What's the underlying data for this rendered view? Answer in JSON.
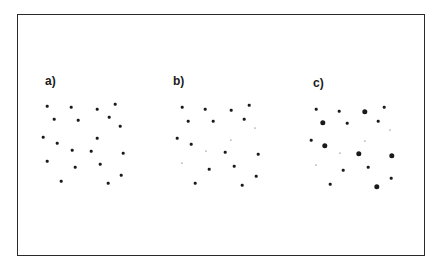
{
  "figure": {
    "panels": [
      {
        "label": "a)",
        "label_pos": [
          45,
          86
        ],
        "dots": [
          {
            "x": 47,
            "y": 106,
            "r": 1.3
          },
          {
            "x": 71,
            "y": 107,
            "r": 1.3
          },
          {
            "x": 97,
            "y": 109,
            "r": 1.3
          },
          {
            "x": 115,
            "y": 104,
            "r": 1.3
          },
          {
            "x": 54,
            "y": 119,
            "r": 1.3
          },
          {
            "x": 78,
            "y": 120,
            "r": 1.3
          },
          {
            "x": 109,
            "y": 117,
            "r": 1.3
          },
          {
            "x": 120,
            "y": 126,
            "r": 1.3
          },
          {
            "x": 43,
            "y": 137,
            "r": 1.3
          },
          {
            "x": 57,
            "y": 143,
            "r": 1.3
          },
          {
            "x": 97,
            "y": 138,
            "r": 1.3
          },
          {
            "x": 72,
            "y": 150,
            "r": 1.3
          },
          {
            "x": 91,
            "y": 151,
            "r": 1.3
          },
          {
            "x": 123,
            "y": 153,
            "r": 1.3
          },
          {
            "x": 47,
            "y": 161,
            "r": 1.3
          },
          {
            "x": 75,
            "y": 167,
            "r": 1.3
          },
          {
            "x": 100,
            "y": 164,
            "r": 1.3
          },
          {
            "x": 121,
            "y": 175,
            "r": 1.3
          },
          {
            "x": 61,
            "y": 181,
            "r": 1.3
          },
          {
            "x": 108,
            "y": 183,
            "r": 1.3
          }
        ]
      },
      {
        "label": "b)",
        "label_pos": [
          173,
          86
        ],
        "dots": [
          {
            "x": 182,
            "y": 107,
            "r": 1.3
          },
          {
            "x": 205,
            "y": 109,
            "r": 1.3
          },
          {
            "x": 231,
            "y": 110,
            "r": 1.3
          },
          {
            "x": 249,
            "y": 105,
            "r": 1.3
          },
          {
            "x": 188,
            "y": 121,
            "r": 1.3
          },
          {
            "x": 213,
            "y": 121,
            "r": 1.3
          },
          {
            "x": 244,
            "y": 119,
            "r": 1.3
          },
          {
            "x": 255,
            "y": 128,
            "r": 0.6
          },
          {
            "x": 177,
            "y": 138,
            "r": 1.3
          },
          {
            "x": 191,
            "y": 144,
            "r": 1.3
          },
          {
            "x": 231,
            "y": 140,
            "r": 0.6
          },
          {
            "x": 206,
            "y": 151,
            "r": 0.6
          },
          {
            "x": 225,
            "y": 152,
            "r": 1.3
          },
          {
            "x": 258,
            "y": 154,
            "r": 1.3
          },
          {
            "x": 182,
            "y": 163,
            "r": 0.6
          },
          {
            "x": 209,
            "y": 169,
            "r": 1.3
          },
          {
            "x": 234,
            "y": 166,
            "r": 1.3
          },
          {
            "x": 256,
            "y": 176,
            "r": 1.3
          },
          {
            "x": 195,
            "y": 183,
            "r": 1.3
          },
          {
            "x": 242,
            "y": 185,
            "r": 1.3
          }
        ]
      },
      {
        "label": "c)",
        "label_pos": [
          313,
          88
        ],
        "dots": [
          {
            "x": 316,
            "y": 109,
            "r": 1.3
          },
          {
            "x": 339,
            "y": 111,
            "r": 1.3
          },
          {
            "x": 365,
            "y": 112,
            "r": 2.7
          },
          {
            "x": 384,
            "y": 107,
            "r": 1.3
          },
          {
            "x": 323,
            "y": 123,
            "r": 2.7
          },
          {
            "x": 347,
            "y": 123,
            "r": 1.3
          },
          {
            "x": 378,
            "y": 121,
            "r": 1.3
          },
          {
            "x": 390,
            "y": 130,
            "r": 0.6
          },
          {
            "x": 311,
            "y": 140,
            "r": 1.3
          },
          {
            "x": 325,
            "y": 146,
            "r": 2.7
          },
          {
            "x": 365,
            "y": 141,
            "r": 0.6
          },
          {
            "x": 340,
            "y": 153,
            "r": 0.6
          },
          {
            "x": 359,
            "y": 154,
            "r": 2.7
          },
          {
            "x": 392,
            "y": 156,
            "r": 2.7
          },
          {
            "x": 316,
            "y": 165,
            "r": 0.6
          },
          {
            "x": 343,
            "y": 170,
            "r": 1.3
          },
          {
            "x": 368,
            "y": 167,
            "r": 1.3
          },
          {
            "x": 391,
            "y": 178,
            "r": 1.3
          },
          {
            "x": 330,
            "y": 184,
            "r": 1.3
          },
          {
            "x": 377,
            "y": 187,
            "r": 2.7
          }
        ]
      }
    ]
  },
  "colors": {
    "dot": "#1a1a1a",
    "border": "#2a2a2a",
    "background": "#ffffff"
  }
}
